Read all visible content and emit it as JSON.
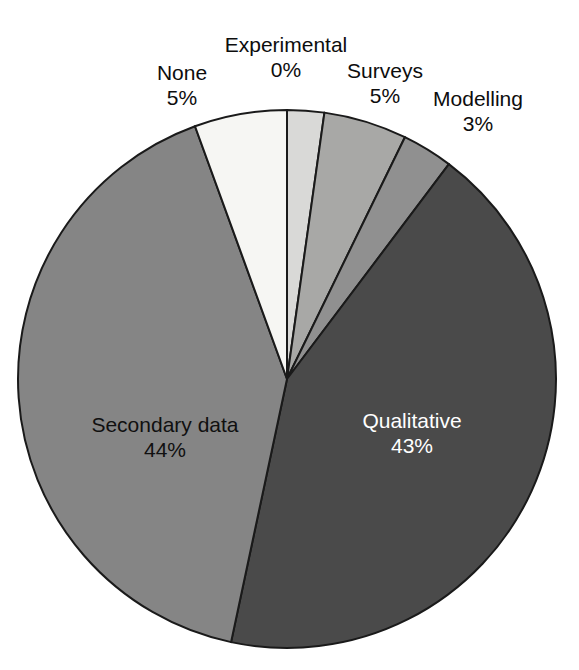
{
  "chart_data": {
    "type": "pie",
    "title": "",
    "subtitle": "",
    "xlabel": "",
    "ylabel": "",
    "grid": false,
    "legend_position": "none",
    "label_format": "name + percent",
    "start_angle_deg": 0,
    "direction": "clockwise",
    "center": {
      "x": 287,
      "y": 379
    },
    "radius": 269,
    "categories": [
      "Experimental",
      "Surveys",
      "Modelling",
      "Qualitative",
      "Secondary data",
      "None"
    ],
    "values": [
      0,
      5,
      3,
      43,
      44,
      5
    ],
    "slices": [
      {
        "name": "Experimental",
        "percent_label": "0%",
        "value": 0,
        "color": "#d9d9d7",
        "label_placement": "outside",
        "label_color": "#0d0d0d",
        "start_deg": 0,
        "end_deg": 8
      },
      {
        "name": "Surveys",
        "percent_label": "5%",
        "value": 5,
        "color": "#a8a8a6",
        "label_placement": "outside",
        "label_color": "#0d0d0d",
        "start_deg": 8,
        "end_deg": 26
      },
      {
        "name": "Modelling",
        "percent_label": "3%",
        "value": 3,
        "color": "#909090",
        "label_placement": "outside",
        "label_color": "#0d0d0d",
        "start_deg": 26,
        "end_deg": 37
      },
      {
        "name": "Qualitative",
        "percent_label": "43%",
        "value": 43,
        "color": "#4a4a4a",
        "label_placement": "inside",
        "label_color": "#ffffff",
        "start_deg": 37,
        "end_deg": 192
      },
      {
        "name": "Secondary data",
        "percent_label": "44%",
        "value": 44,
        "color": "#858585",
        "label_placement": "inside",
        "label_color": "#101010",
        "start_deg": 192,
        "end_deg": 340
      },
      {
        "name": "None",
        "percent_label": "5%",
        "value": 5,
        "color": "#f6f6f3",
        "label_placement": "outside",
        "label_color": "#0d0d0d",
        "start_deg": 340,
        "end_deg": 360
      }
    ],
    "stroke_color": "#1a1a1a",
    "background": "#ffffff"
  },
  "labels": {
    "experimental": {
      "name": "Experimental",
      "pct": "0%"
    },
    "none": {
      "name": "None",
      "pct": "5%"
    },
    "surveys": {
      "name": "Surveys",
      "pct": "5%"
    },
    "modelling": {
      "name": "Modelling",
      "pct": "3%"
    },
    "secondary": {
      "name": "Secondary data",
      "pct": "44%"
    },
    "qualitative": {
      "name": "Qualitative",
      "pct": "43%"
    }
  }
}
